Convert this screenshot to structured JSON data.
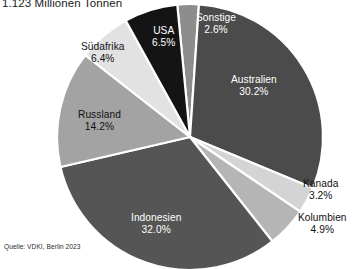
{
  "chart": {
    "title": "1.123 Millionen Tonnen",
    "source": "Quelle: VDKI, Berlin 2023"
  },
  "chart_data": {
    "type": "pie",
    "title": "1.123 Millionen Tonnen",
    "subtitle": "",
    "xlabel": "",
    "ylabel": "",
    "unit": "%",
    "total_label": "1.123 Millionen Tonnen",
    "legend_position": "none",
    "labels_on_slices": true,
    "grid": false,
    "source": "Quelle: VDKI, Berlin 2023",
    "categories": [
      "Sonstige",
      "Australien",
      "Kanada",
      "Kolumbien",
      "Indonesien",
      "Russland",
      "Südafrika",
      "USA"
    ],
    "values": [
      2.6,
      30.2,
      3.2,
      4.9,
      32.0,
      14.2,
      6.4,
      6.5
    ],
    "colors": [
      "#8d8d8d",
      "#4b4b4b",
      "#d4d4d4",
      "#b5b5b5",
      "#555555",
      "#a3a3a3",
      "#e2e2e2",
      "#141414"
    ],
    "slices": [
      {
        "label": "Sonstige",
        "value": 2.6,
        "text": "2.6%",
        "color": "#8d8d8d",
        "label_color": "light"
      },
      {
        "label": "Australien",
        "value": 30.2,
        "text": "30.2%",
        "color": "#4b4b4b",
        "label_color": "light"
      },
      {
        "label": "Kanada",
        "value": 3.2,
        "text": "3.2%",
        "color": "#d4d4d4",
        "label_color": "dark"
      },
      {
        "label": "Kolumbien",
        "value": 4.9,
        "text": "4.9%",
        "color": "#b5b5b5",
        "label_color": "dark"
      },
      {
        "label": "Indonesien",
        "value": 32.0,
        "text": "32.0%",
        "color": "#555555",
        "label_color": "light"
      },
      {
        "label": "Russland",
        "value": 14.2,
        "text": "14.2%",
        "color": "#a3a3a3",
        "label_color": "dark"
      },
      {
        "label": "Südafrika",
        "value": 6.4,
        "text": "6.4%",
        "color": "#e2e2e2",
        "label_color": "dark"
      },
      {
        "label": "USA",
        "value": 6.5,
        "text": "6.5%",
        "color": "#141414",
        "label_color": "light"
      }
    ],
    "geometry": {
      "cx": 190,
      "cy": 137,
      "r": 133,
      "start_angle_deg": -5.5
    }
  },
  "labels": {
    "sonstige": {
      "name": "Sonstige",
      "pct": "2.6%"
    },
    "australien": {
      "name": "Australien",
      "pct": "30.2%"
    },
    "kanada": {
      "name": "Kanada",
      "pct": "3.2%"
    },
    "kolumbien": {
      "name": "Kolumbien",
      "pct": "4.9%"
    },
    "indonesien": {
      "name": "Indonesien",
      "pct": "32.0%"
    },
    "russland": {
      "name": "Russland",
      "pct": "14.2%"
    },
    "suedafrika": {
      "name": "Südafrika",
      "pct": "6.4%"
    },
    "usa": {
      "name": "USA",
      "pct": "6.5%"
    }
  }
}
